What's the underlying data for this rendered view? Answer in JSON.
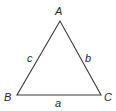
{
  "diagram": {
    "type": "triangle",
    "stroke_color": "#3a3a3a",
    "label_color": "#2a2a2a",
    "vertices": {
      "A": {
        "label": "A",
        "x": 60,
        "y": 21
      },
      "B": {
        "label": "B",
        "x": 17,
        "y": 95
      },
      "C": {
        "label": "C",
        "x": 101,
        "y": 95
      }
    },
    "sides": {
      "a": {
        "label": "a",
        "between": [
          "B",
          "C"
        ]
      },
      "b": {
        "label": "b",
        "between": [
          "A",
          "C"
        ]
      },
      "c": {
        "label": "c",
        "between": [
          "A",
          "B"
        ]
      }
    }
  }
}
